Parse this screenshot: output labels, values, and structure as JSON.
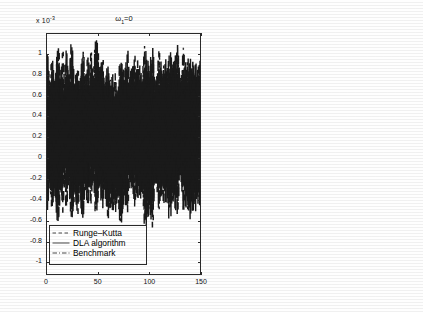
{
  "figure": {
    "background": "#ffffff",
    "ink_color": "#1a1a1a",
    "panel_count": 2
  },
  "panels": [
    {
      "id": "left",
      "title": "ω",
      "title_sub": "1",
      "title_eq": "=0",
      "exp_prefix": "x 10",
      "exp_power": "-3",
      "legend": {
        "entries": [
          {
            "label": "Runge–Kutta",
            "style": "dashed"
          },
          {
            "label": "DLA algorithm",
            "style": "solid"
          },
          {
            "label": "Benchmark",
            "style": "dashdot"
          }
        ]
      }
    },
    {
      "id": "right",
      "title": "ω",
      "title_sub": "2",
      "title_eq": "=0",
      "exp_prefix": "x 10",
      "exp_power": "-3",
      "legend": null
    }
  ],
  "chart_data": [
    {
      "type": "line",
      "panel": "left",
      "title": "ω₁=0",
      "xlabel": "",
      "ylabel": "",
      "y_scale_factor": "x 10^-3",
      "xlim": [
        0,
        150
      ],
      "ylim": [
        -1.12,
        1.2
      ],
      "xticks": [
        0,
        50,
        100,
        150
      ],
      "xtick_labels": [
        "0",
        "50",
        "100",
        "150"
      ],
      "yticks": [
        1,
        0.8,
        0.6,
        0.4,
        0.2,
        0,
        -0.2,
        -0.4,
        -0.6,
        -0.8,
        -1
      ],
      "ytick_labels": [
        "1",
        "0.8",
        "0.6",
        "0.4",
        "0.2",
        "0",
        "-0.2",
        "-0.4",
        "-0.6",
        "-0.8",
        "-1"
      ],
      "grid": false,
      "legend_position": "lower-left",
      "series": [
        {
          "name": "Runge–Kutta",
          "style": "dashed",
          "color": "#1a1a1a"
        },
        {
          "name": "DLA algorithm",
          "style": "solid",
          "color": "#1a1a1a"
        },
        {
          "name": "Benchmark",
          "style": "dashdot",
          "color": "#1a1a1a"
        }
      ],
      "description": "Dense high-frequency oscillation, three overlaid curves nearly coincident; envelope biased positive, upper bound near +1.15 and lower bound near -0.75, mean offset roughly +0.25",
      "envelope": {
        "x": [
          0,
          10,
          20,
          30,
          40,
          50,
          60,
          70,
          80,
          90,
          100,
          110,
          120,
          130,
          140,
          150
        ],
        "upper": [
          1.14,
          1.1,
          1.16,
          1.05,
          1.12,
          1.16,
          1.02,
          0.92,
          1.1,
          1.15,
          1.05,
          1.13,
          1.08,
          1.16,
          1.06,
          1.12
        ],
        "lower": [
          -0.62,
          -0.7,
          -0.58,
          -0.74,
          -0.6,
          -0.52,
          -0.72,
          -0.68,
          -0.55,
          -0.63,
          -0.73,
          -0.58,
          -0.66,
          -0.54,
          -0.7,
          -0.6
        ],
        "mean": [
          0.26,
          0.22,
          0.3,
          0.18,
          0.28,
          0.32,
          0.16,
          0.12,
          0.28,
          0.26,
          0.18,
          0.28,
          0.22,
          0.31,
          0.2,
          0.26
        ]
      }
    },
    {
      "type": "line",
      "panel": "right",
      "title": "ω₂=0",
      "xlabel": "",
      "ylabel": "",
      "y_scale_factor": "x 10^-3",
      "xlim": [
        0,
        150
      ],
      "ylim": [
        -1.12,
        1.2
      ],
      "xticks": [
        0,
        50,
        100,
        150
      ],
      "xtick_labels": [
        "0",
        "50",
        "100",
        "150"
      ],
      "yticks": [
        1,
        0.8,
        0.6,
        0.4,
        0.2,
        0,
        -0.2,
        -0.4,
        -0.6,
        -0.8,
        -1
      ],
      "ytick_labels": [
        "1",
        "0.8",
        "0.6",
        "0.4",
        "0.2",
        "0",
        "-0.2",
        "-0.4",
        "-0.6",
        "-0.8",
        "-1"
      ],
      "grid": false,
      "legend_position": "none",
      "series": [
        {
          "name": "Runge–Kutta",
          "style": "dashed",
          "color": "#1a1a1a"
        },
        {
          "name": "DLA algorithm",
          "style": "solid",
          "color": "#1a1a1a"
        },
        {
          "name": "Benchmark",
          "style": "dashdot",
          "color": "#1a1a1a"
        }
      ],
      "description": "Dense high-frequency oscillation roughly symmetric about zero; envelope upper bound near +0.75 and lower bound near -1.0",
      "envelope": {
        "x": [
          0,
          10,
          20,
          30,
          40,
          50,
          60,
          70,
          80,
          90,
          100,
          110,
          120,
          130,
          140,
          150
        ],
        "upper": [
          0.58,
          0.64,
          0.7,
          0.6,
          0.56,
          0.72,
          0.66,
          0.74,
          0.62,
          0.58,
          0.68,
          0.76,
          0.64,
          0.7,
          0.6,
          0.62
        ],
        "lower": [
          -0.92,
          -0.88,
          -0.96,
          -1.0,
          -0.86,
          -0.94,
          -0.9,
          -0.98,
          -0.84,
          -0.92,
          -0.88,
          -1.0,
          -0.9,
          -0.94,
          -0.86,
          -0.9
        ],
        "mean": [
          -0.16,
          -0.12,
          -0.14,
          -0.2,
          -0.15,
          -0.11,
          -0.13,
          -0.12,
          -0.11,
          -0.17,
          -0.1,
          -0.12,
          -0.13,
          -0.12,
          -0.13,
          -0.14
        ]
      }
    }
  ]
}
